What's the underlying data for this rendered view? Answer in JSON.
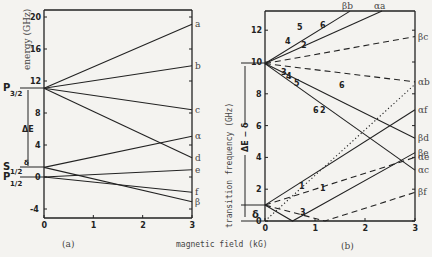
{
  "figure": {
    "shared_xlabel": "magnetic field (kG)",
    "panel_a_label": "(a)",
    "panel_b_label": "(b)"
  },
  "chart_data": [
    {
      "type": "line",
      "title": "(a)",
      "xlabel": "magnetic field (kG)",
      "ylabel": "energy (GHz)",
      "xlim": [
        0,
        3
      ],
      "ylim": [
        -5,
        21
      ],
      "xticks": [
        "0",
        "1",
        "2",
        "3"
      ],
      "yticks": [
        "-4",
        "0",
        "4",
        "8",
        "12",
        "16",
        "20"
      ],
      "grid": false,
      "annotations": [
        "P3/2",
        "S1/2",
        "P1/2",
        "ΔE",
        "δ"
      ],
      "levels": {
        "P3/2": 11.1,
        "S1/2": 1.2,
        "P1/2": 0
      },
      "series": [
        {
          "name": "a",
          "x": [
            0,
            3
          ],
          "values": [
            11.1,
            19.1
          ],
          "style": "solid"
        },
        {
          "name": "b",
          "x": [
            0,
            3
          ],
          "values": [
            11.1,
            13.9
          ],
          "style": "solid"
        },
        {
          "name": "c",
          "x": [
            0,
            3
          ],
          "values": [
            11.1,
            8.4
          ],
          "style": "solid"
        },
        {
          "name": "d",
          "x": [
            0,
            3
          ],
          "values": [
            11.1,
            2.4
          ],
          "style": "solid"
        },
        {
          "name": "α",
          "x": [
            0,
            3
          ],
          "values": [
            1.2,
            5.1
          ],
          "style": "solid"
        },
        {
          "name": "β",
          "x": [
            0,
            3
          ],
          "values": [
            1.2,
            -3.1
          ],
          "style": "solid"
        },
        {
          "name": "e",
          "x": [
            0,
            3
          ],
          "values": [
            0,
            0.9
          ],
          "style": "solid"
        },
        {
          "name": "f",
          "x": [
            0,
            3
          ],
          "values": [
            0,
            -1.9
          ],
          "style": "solid"
        }
      ]
    },
    {
      "type": "line",
      "title": "(b)",
      "xlabel": "magnetic field (kG)",
      "ylabel": "transition frequency (GHz)",
      "xlim": [
        0,
        3
      ],
      "ylim": [
        0,
        13.2
      ],
      "xticks": [
        "0",
        "1",
        "2",
        "3"
      ],
      "yticks": [
        "0",
        "2",
        "4",
        "6",
        "8",
        "10",
        "12"
      ],
      "grid": false,
      "annotations": [
        "ΔE - δ",
        "δ",
        "1",
        "2",
        "3",
        "4",
        "5",
        "6"
      ],
      "series": [
        {
          "name": "βb",
          "x": [
            0,
            1.7
          ],
          "values": [
            9.9,
            13.2
          ],
          "style": "solid"
        },
        {
          "name": "αa",
          "x": [
            0,
            2.34
          ],
          "values": [
            9.9,
            13.2
          ],
          "style": "solid"
        },
        {
          "name": "βc",
          "x": [
            0,
            3
          ],
          "values": [
            9.9,
            11.6
          ],
          "style": "dashed"
        },
        {
          "name": "αb",
          "x": [
            0,
            3
          ],
          "values": [
            9.9,
            8.75
          ],
          "style": "dashed"
        },
        {
          "name": "βd",
          "x": [
            0,
            3
          ],
          "values": [
            9.9,
            5.2
          ],
          "style": "solid"
        },
        {
          "name": "αc",
          "x": [
            0,
            3
          ],
          "values": [
            9.9,
            3.2
          ],
          "style": "solid"
        },
        {
          "name": "αf",
          "x": [
            0,
            3
          ],
          "values": [
            1.0,
            7.0
          ],
          "style": "solid"
        },
        {
          "name": "βe",
          "x": [
            0,
            0.55,
            3
          ],
          "values": [
            1.0,
            0,
            4.3
          ],
          "style": "solid"
        },
        {
          "name": "αe",
          "x": [
            0,
            3
          ],
          "values": [
            1.0,
            4.0
          ],
          "style": "dashed"
        },
        {
          "name": "βf",
          "x": [
            0,
            1.2,
            3
          ],
          "values": [
            1.0,
            0,
            1.8
          ],
          "style": "dashed"
        },
        {
          "name": "dotted",
          "x": [
            0,
            3
          ],
          "values": [
            0,
            8.6
          ],
          "style": "dotted"
        }
      ],
      "right_labels": [
        "βb",
        "αa",
        "βc",
        "αb",
        "αf",
        "βd",
        "βe",
        "αe",
        "αc",
        "βf"
      ]
    }
  ]
}
